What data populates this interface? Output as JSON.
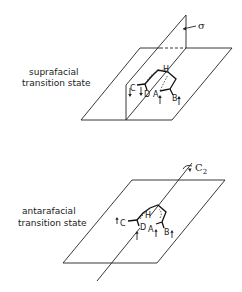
{
  "diagrams": [
    {
      "id": "suprafacial",
      "caption_line1": "suprafacial",
      "caption_line2": "transition state",
      "symmetry_label": "σ",
      "symmetry_element": "mirror-plane",
      "atoms": {
        "H": "H",
        "A": "A",
        "B": "B",
        "C": "C",
        "D": "D"
      }
    },
    {
      "id": "antarafacial",
      "caption_line1": "antarafacial",
      "caption_line2": "transition state",
      "symmetry_label": "C",
      "symmetry_subscript": "2",
      "symmetry_element": "two-fold-axis",
      "atoms": {
        "H": "H",
        "A": "A",
        "B": "B",
        "C": "C",
        "D": "D"
      }
    }
  ]
}
